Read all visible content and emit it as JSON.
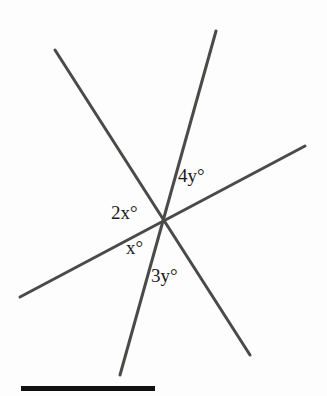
{
  "figure": {
    "type": "geometry-diagram",
    "background_color": "#fdfdfd",
    "line_color": "#4a4a48",
    "line_width": 3,
    "text_color": "#1a1a1a",
    "intersection_point": {
      "x": 163,
      "y": 223
    },
    "lines": [
      {
        "name": "line-falling-left-to-right",
        "x1": 55,
        "y1": 50,
        "x2": 250,
        "y2": 355
      },
      {
        "name": "line-steep-rising",
        "x1": 120,
        "y1": 375,
        "x2": 216,
        "y2": 31
      },
      {
        "name": "line-shallow-rising",
        "x1": 20,
        "y1": 297,
        "x2": 305,
        "y2": 146
      }
    ],
    "labels": [
      {
        "name": "angle-label-2x",
        "text": "2x°",
        "x": 111,
        "y": 203
      },
      {
        "name": "angle-label-x",
        "text": "x°",
        "x": 126,
        "y": 238
      },
      {
        "name": "angle-label-4y",
        "text": "4y°",
        "x": 178,
        "y": 166
      },
      {
        "name": "angle-label-3y",
        "text": "3y°",
        "x": 151,
        "y": 266
      }
    ],
    "rule": {
      "name": "bottom-rule-bar",
      "color": "#111111",
      "x": 21,
      "y": 386,
      "width": 134,
      "height": 5
    }
  }
}
